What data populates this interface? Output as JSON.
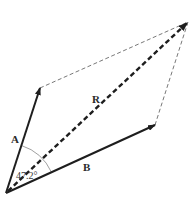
{
  "diagram": {
    "type": "vector-parallelogram-addition",
    "vectors": [
      {
        "name": "A",
        "label": "A",
        "style": "solid",
        "from": [
          6,
          193
        ],
        "to": [
          40,
          88
        ]
      },
      {
        "name": "B",
        "label": "B",
        "style": "solid",
        "from": [
          6,
          193
        ],
        "to": [
          155,
          125
        ]
      },
      {
        "name": "R",
        "label": "R",
        "style": "thick-dashed",
        "from": [
          6,
          193
        ],
        "to": [
          188,
          22
        ]
      }
    ],
    "construction_lines": [
      {
        "from": [
          40,
          88
        ],
        "to": [
          188,
          22
        ],
        "style": "thin-dashed"
      },
      {
        "from": [
          155,
          125
        ],
        "to": [
          188,
          22
        ],
        "style": "thin-dashed"
      }
    ],
    "angle": {
      "label": "47.2°",
      "between": [
        "A",
        "B"
      ]
    },
    "labels": {
      "A": "A",
      "B": "B",
      "R": "R",
      "angle": "47.2°"
    },
    "colors": {
      "vector": "#1e1e1e",
      "construction": "#555555",
      "arc": "#888888",
      "background": "#ffffff"
    }
  }
}
